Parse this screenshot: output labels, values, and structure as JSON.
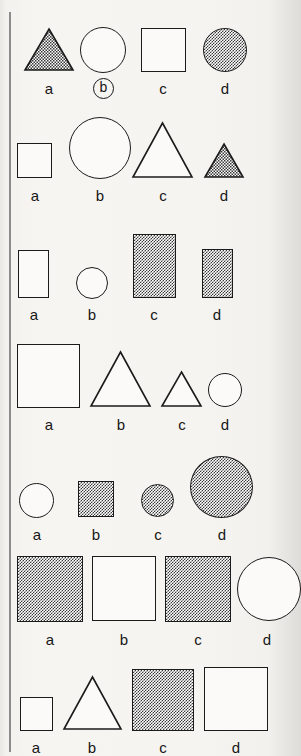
{
  "sheet": {
    "kind": "printed-test-sheet",
    "background_color": "#f5f4f1",
    "ink_color": "#1b1b1b",
    "fill_pattern": "50% checkerboard halftone",
    "margin_rule_color": "#8b8b8b",
    "option_letters": [
      "a",
      "b",
      "c",
      "d"
    ],
    "marked_answer": {
      "row": 1,
      "option": "b"
    }
  },
  "rows": [
    {
      "index": 1,
      "options": [
        {
          "letter": "a",
          "shape": "triangle",
          "fill": "shaded",
          "size_px": 48
        },
        {
          "letter": "b",
          "shape": "circle",
          "fill": "open",
          "size_px": 46,
          "marked": true
        },
        {
          "letter": "c",
          "shape": "square",
          "fill": "open",
          "size_px": 44
        },
        {
          "letter": "d",
          "shape": "circle",
          "fill": "shaded",
          "size_px": 43
        }
      ]
    },
    {
      "index": 2,
      "options": [
        {
          "letter": "a",
          "shape": "square",
          "fill": "open",
          "size_px": 35
        },
        {
          "letter": "b",
          "shape": "circle",
          "fill": "open",
          "size_px": 62
        },
        {
          "letter": "c",
          "shape": "triangle",
          "fill": "open",
          "size_px": 58
        },
        {
          "letter": "d",
          "shape": "triangle",
          "fill": "shaded",
          "size_px": 37
        }
      ]
    },
    {
      "index": 3,
      "options": [
        {
          "letter": "a",
          "shape": "rectangle",
          "fill": "open",
          "size_px": 48
        },
        {
          "letter": "b",
          "shape": "circle",
          "fill": "open",
          "size_px": 32
        },
        {
          "letter": "c",
          "shape": "rectangle",
          "fill": "shaded",
          "size_px": 64
        },
        {
          "letter": "d",
          "shape": "rectangle",
          "fill": "shaded",
          "size_px": 49
        }
      ]
    },
    {
      "index": 4,
      "options": [
        {
          "letter": "a",
          "shape": "square",
          "fill": "open",
          "size_px": 64
        },
        {
          "letter": "b",
          "shape": "triangle",
          "fill": "open",
          "size_px": 58
        },
        {
          "letter": "c",
          "shape": "triangle",
          "fill": "open",
          "size_px": 38
        },
        {
          "letter": "d",
          "shape": "circle",
          "fill": "open",
          "size_px": 34
        }
      ]
    },
    {
      "index": 5,
      "options": [
        {
          "letter": "a",
          "shape": "circle",
          "fill": "open",
          "size_px": 35
        },
        {
          "letter": "b",
          "shape": "square",
          "fill": "shaded",
          "size_px": 36
        },
        {
          "letter": "c",
          "shape": "circle",
          "fill": "shaded",
          "size_px": 32
        },
        {
          "letter": "d",
          "shape": "circle",
          "fill": "shaded",
          "size_px": 62
        }
      ]
    },
    {
      "index": 6,
      "options": [
        {
          "letter": "a",
          "shape": "square",
          "fill": "shaded",
          "size_px": 66
        },
        {
          "letter": "b",
          "shape": "square",
          "fill": "open",
          "size_px": 64
        },
        {
          "letter": "c",
          "shape": "square",
          "fill": "shaded",
          "size_px": 66
        },
        {
          "letter": "d",
          "shape": "circle",
          "fill": "open",
          "size_px": 64
        }
      ]
    },
    {
      "index": 7,
      "options": [
        {
          "letter": "a",
          "shape": "square",
          "fill": "open",
          "size_px": 34
        },
        {
          "letter": "b",
          "shape": "triangle",
          "fill": "open",
          "size_px": 56
        },
        {
          "letter": "c",
          "shape": "square",
          "fill": "shaded",
          "size_px": 62
        },
        {
          "letter": "d",
          "shape": "square",
          "fill": "open",
          "size_px": 64
        }
      ]
    }
  ]
}
